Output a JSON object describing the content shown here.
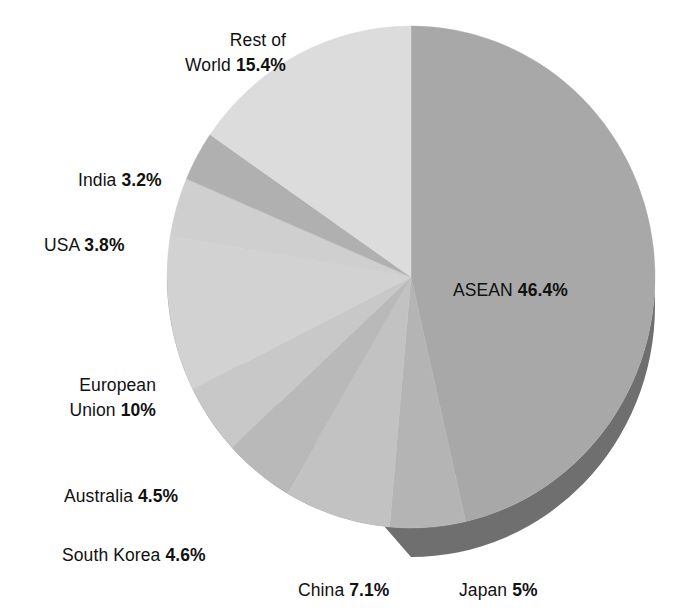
{
  "chart_data": {
    "type": "pie",
    "title": "",
    "subtitle": "",
    "xlabel": "",
    "ylabel": "",
    "legend_position": "none",
    "grid": false,
    "value_unit": "percent",
    "start_angle_deg": 0,
    "direction": "clockwise",
    "style": "3d-pie-with-extruded-base",
    "categories": [
      "ASEAN",
      "Japan",
      "China",
      "South Korea",
      "Australia",
      "European Union",
      "USA",
      "India",
      "Rest of World"
    ],
    "values": [
      46.4,
      5,
      7.1,
      4.6,
      4.5,
      10,
      3.8,
      3.2,
      15.4
    ],
    "slices": [
      {
        "name": "ASEAN",
        "label": "ASEAN",
        "value": 46.4,
        "value_text": "46.4%",
        "color": "#a8a8a8",
        "side_color": "#6f6f6f",
        "start_deg": 0,
        "end_deg": 167.04,
        "label_placement": "inside"
      },
      {
        "name": "Japan",
        "label": "Japan",
        "value": 5,
        "value_text": "5%",
        "color": "#b4b4b4",
        "side_color": "#707070",
        "start_deg": 167.04,
        "end_deg": 185.04,
        "label_placement": "outside"
      },
      {
        "name": "China",
        "label": "China",
        "value": 7.1,
        "value_text": "7.1%",
        "color": "#c2c2c2",
        "side_color": "#6d6d6d",
        "start_deg": 185.04,
        "end_deg": 210.6,
        "label_placement": "outside"
      },
      {
        "name": "South Korea",
        "label": "South Korea",
        "value": 4.6,
        "value_text": "4.6%",
        "color": "#b9b9b9",
        "side_color": "#6d6d6d",
        "start_deg": 210.6,
        "end_deg": 227.16,
        "label_placement": "outside"
      },
      {
        "name": "Australia",
        "label": "Australia",
        "value": 4.5,
        "value_text": "4.5%",
        "color": "#c8c8c8",
        "side_color": "#6d6d6d",
        "start_deg": 227.16,
        "end_deg": 243.36,
        "label_placement": "outside"
      },
      {
        "name": "European Union",
        "label": "European Union",
        "value": 10,
        "value_text": "10%",
        "color": "#d2d2d2",
        "side_color": "#6d6d6d",
        "start_deg": 243.36,
        "end_deg": 279.36,
        "label_placement": "outside"
      },
      {
        "name": "USA",
        "label": "USA",
        "value": 3.8,
        "value_text": "3.8%",
        "color": "#cfcfcf",
        "side_color": "#6d6d6d",
        "start_deg": 279.36,
        "end_deg": 293.04,
        "label_placement": "outside"
      },
      {
        "name": "India",
        "label": "India",
        "value": 3.2,
        "value_text": "3.2%",
        "color": "#b0b0b0",
        "side_color": "#6d6d6d",
        "start_deg": 293.04,
        "end_deg": 304.56,
        "label_placement": "outside"
      },
      {
        "name": "Rest of World",
        "label": "Rest of World",
        "value": 15.4,
        "value_text": "15.4%",
        "color": "#dcdcdc",
        "side_color": "#6d6d6d",
        "start_deg": 304.56,
        "end_deg": 360,
        "label_placement": "outside"
      }
    ]
  },
  "labels": {
    "rest_of_world": {
      "line1": "Rest of",
      "name": "World",
      "value_text": "15.4%"
    },
    "india": {
      "name": "India",
      "value_text": "3.2%"
    },
    "usa": {
      "name": "USA",
      "value_text": "3.8%"
    },
    "european_union": {
      "line1": "European",
      "name": "Union",
      "value_text": "10%"
    },
    "australia": {
      "name": "Australia",
      "value_text": "4.5%"
    },
    "south_korea": {
      "name": "South Korea",
      "value_text": "4.6%"
    },
    "china": {
      "name": "China",
      "value_text": "7.1%"
    },
    "japan": {
      "name": "Japan",
      "value_text": "5%"
    },
    "asean": {
      "name": "ASEAN",
      "value_text": "46.4%"
    }
  },
  "colors": {
    "background": "#ffffff",
    "text": "#111111",
    "pie_base_rim": "#6d6d6d",
    "largest_slice": "#a8a8a8",
    "smallest_slice": "#b0b0b0"
  }
}
